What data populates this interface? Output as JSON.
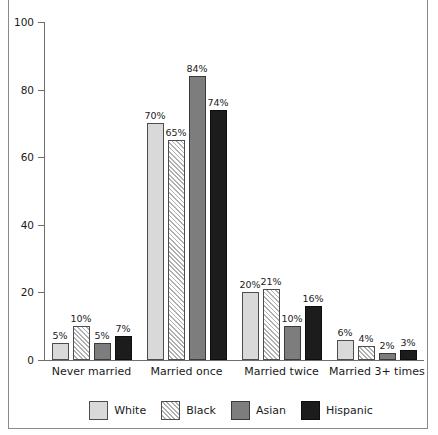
{
  "chart_data": {
    "type": "bar",
    "title": "",
    "subtitle": "",
    "xlabel": "",
    "ylabel": "",
    "ylim": [
      0,
      100
    ],
    "yticks": [
      0,
      20,
      40,
      60,
      80,
      100
    ],
    "grid": false,
    "legend_position": "bottom",
    "categories": [
      "Never married",
      "Married once",
      "Married twice",
      "Married 3+ times"
    ],
    "series": [
      {
        "name": "White",
        "color": "#d9d9d9",
        "pattern": "solid",
        "values": [
          5,
          70,
          20,
          6
        ],
        "labels": [
          "5%",
          "70%",
          "20%",
          "6%"
        ]
      },
      {
        "name": "Black",
        "color": "#ffffff",
        "pattern": "diagonal-hatch",
        "values": [
          10,
          65,
          21,
          4
        ],
        "labels": [
          "10%",
          "65%",
          "21%",
          "4%"
        ]
      },
      {
        "name": "Asian",
        "color": "#7d7d7d",
        "pattern": "solid",
        "values": [
          5,
          84,
          10,
          2
        ],
        "labels": [
          "5%",
          "84%",
          "10%",
          "2%"
        ]
      },
      {
        "name": "Hispanic",
        "color": "#1c1c1c",
        "pattern": "solid",
        "values": [
          7,
          74,
          16,
          3
        ],
        "labels": [
          "7%",
          "74%",
          "16%",
          "3%"
        ]
      }
    ]
  },
  "axis": {
    "y_tick_labels": [
      "0",
      "20",
      "40",
      "60",
      "80",
      "100"
    ]
  },
  "legend": {
    "items": [
      {
        "label": "White",
        "swatch": "swatch-white"
      },
      {
        "label": "Black",
        "swatch": "swatch-black-hatch"
      },
      {
        "label": "Asian",
        "swatch": "swatch-asian"
      },
      {
        "label": "Hispanic",
        "swatch": "swatch-hispanic"
      }
    ]
  }
}
